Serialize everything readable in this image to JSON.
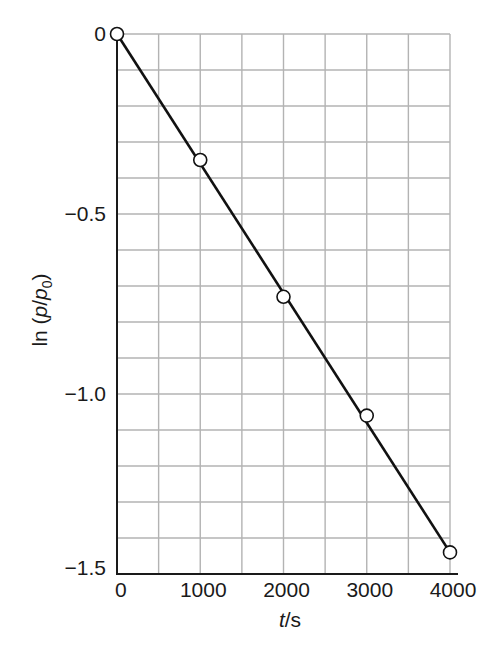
{
  "chart_data": {
    "type": "scatter",
    "title": "",
    "xlabel": "t/s",
    "ylabel": "ln (p/p0)",
    "xlim": [
      0,
      4000
    ],
    "ylim": [
      -1.5,
      0
    ],
    "grid": true,
    "legend": null,
    "x_ticks": [
      0,
      1000,
      2000,
      3000,
      4000
    ],
    "x_tick_labels": [
      "0",
      "1000",
      "2000",
      "3000",
      "4000"
    ],
    "y_ticks": [
      0,
      -0.5,
      -1.0,
      -1.5
    ],
    "y_tick_labels": [
      "0",
      "−0.5",
      "−1.0",
      "−1.5"
    ],
    "x_grid_step": 500,
    "y_grid_step": 0.1,
    "series": [
      {
        "name": "data",
        "marker": "open-circle",
        "x": [
          0,
          1000,
          2000,
          3000,
          4000
        ],
        "y": [
          0,
          -0.35,
          -0.73,
          -1.06,
          -1.44
        ]
      },
      {
        "name": "fit",
        "style": "line",
        "x": [
          0,
          4000
        ],
        "y": [
          0,
          -1.44
        ]
      }
    ]
  },
  "labels": {
    "xlabel_italic": "t",
    "xlabel_rest": "/s",
    "ylabel_prefix": "ln (",
    "ylabel_p": "p",
    "ylabel_slash": "/",
    "ylabel_p0": "p",
    "ylabel_sub": "0",
    "ylabel_suffix": ")"
  },
  "colors": {
    "grid": "#b3b3b3",
    "axis": "#1a1a1a",
    "line": "#111111",
    "marker_fill": "#ffffff"
  }
}
